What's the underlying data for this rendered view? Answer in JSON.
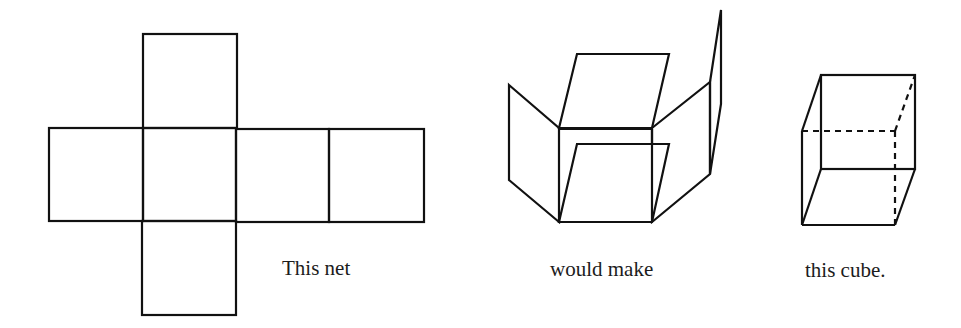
{
  "diagram": {
    "stroke_color": "#111111",
    "background": "#ffffff",
    "captions": {
      "net": "This net",
      "folding": "would make",
      "cube": "this cube."
    },
    "parts": [
      {
        "name": "cube-net",
        "description": "cross-shaped net of six squares: one above, four in a row, one below"
      },
      {
        "name": "partially-folded-net",
        "description": "net with faces partially folded upward"
      },
      {
        "name": "cube",
        "description": "wireframe cube with hidden edges dashed"
      }
    ]
  }
}
